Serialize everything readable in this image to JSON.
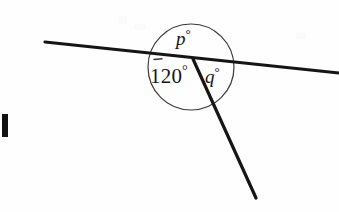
{
  "figure": {
    "type": "geometry-diagram",
    "background_color": "#fefefe",
    "stroke_color": "#151515",
    "circle_stroke_color": "#3a3a3a",
    "labels": {
      "p": {
        "value": "p",
        "degree_symbol": "°",
        "position": "above-vertex"
      },
      "known_angle": {
        "value": "120",
        "degree_symbol": "°",
        "position": "below-left-of-vertex"
      },
      "q": {
        "value": "q",
        "degree_symbol": "°",
        "position": "below-right-of-vertex"
      }
    },
    "geometry": {
      "vertex": {
        "x": 193,
        "y": 59
      },
      "circle": {
        "cx": 191,
        "cy": 67,
        "r": 43
      },
      "straight_line": {
        "start": {
          "x": 45,
          "y": 42
        },
        "end": {
          "x": 339,
          "y": 73
        },
        "stroke_width": 3.2
      },
      "ray": {
        "start": {
          "x": 193,
          "y": 59
        },
        "end": {
          "x": 256,
          "y": 198
        },
        "stroke_width": 3.2
      },
      "tick_over_one": {
        "x1": 154,
        "y1": 60,
        "x2": 162,
        "y2": 59
      }
    },
    "edge_mark": {
      "x": 2,
      "y": 114,
      "width": 6,
      "height": 23,
      "color": "#111111"
    }
  }
}
